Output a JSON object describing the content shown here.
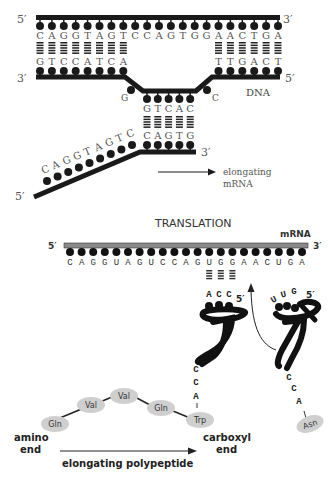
{
  "transcription": {
    "dna_top_strand": {
      "end_left": "5′",
      "end_right": "3′",
      "bases": [
        "C",
        "A",
        "G",
        "G",
        "T",
        "A",
        "G",
        "T",
        "C",
        "C",
        "A",
        "G",
        "T",
        "G",
        "G",
        "A",
        "A",
        "C",
        "T",
        "G",
        "A"
      ]
    },
    "dna_bottom_strand": {
      "end_left": "3′",
      "end_right": "5′",
      "left_bases": [
        "G",
        "T",
        "C",
        "C",
        "A",
        "T",
        "C",
        "A"
      ],
      "right_bases": [
        "T",
        "T",
        "G",
        "A",
        "C",
        "T"
      ],
      "bubble_left_base": "G",
      "bubble_right_base": "C",
      "bubble_bases": [
        "G",
        "T",
        "C",
        "A",
        "C"
      ]
    },
    "dna_label": "DNA",
    "mrna": {
      "end_left": "5′",
      "end_right": "3′",
      "diagonal_bases": [
        "C",
        "A",
        "G",
        "G",
        "T",
        "A",
        "G",
        "T",
        "C"
      ],
      "paired_bases": [
        "C",
        "A",
        "G",
        "T",
        "G"
      ]
    },
    "elongating_label_line1": "elongating",
    "elongating_label_line2": "mRNA"
  },
  "translation": {
    "title": "TRANSLATION",
    "mrna_label": "mRNA",
    "end_left": "5′",
    "end_right": "3′",
    "codons": [
      "C",
      "A",
      "G",
      "G",
      "U",
      "A",
      "G",
      "U",
      "C",
      "C",
      "A",
      "G",
      "U",
      "G",
      "G",
      "A",
      "A",
      "C",
      "U",
      "G",
      "A"
    ],
    "trna_left": {
      "anticodon": [
        "A",
        "C",
        "C"
      ],
      "end": "5′",
      "acceptor": [
        "C",
        "C",
        "A"
      ],
      "amino_acid": "Trp"
    },
    "trna_right": {
      "anticodon": [
        "U",
        "U",
        "G"
      ],
      "end": "5′",
      "acceptor": [
        "C",
        "C",
        "A"
      ],
      "amino_acid": "Asn"
    },
    "polypeptide": [
      "Gln",
      "Val",
      "Val",
      "Gln",
      "Trp"
    ],
    "amino_end_line1": "amino",
    "amino_end_line2": "end",
    "carboxyl_end_line1": "carboxyl",
    "carboxyl_end_line2": "end",
    "polypeptide_label": "elongating polypeptide"
  },
  "colors": {
    "strand": "#1a1a1a",
    "mrna_bar": "#8a8a8a",
    "amino_acid_fill": "#cfcfcf",
    "text": "#333333"
  }
}
